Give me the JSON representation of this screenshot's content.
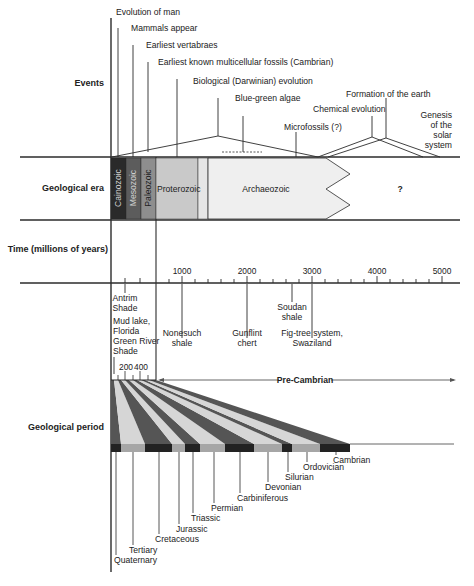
{
  "rows": {
    "events": "Events",
    "era": "Geological era",
    "time": "Time (millions of years)",
    "period": "Geological period"
  },
  "events": [
    {
      "label": "Evolution of man",
      "x": 118,
      "y": 27
    },
    {
      "label": "Mammals appear",
      "x": 133,
      "y": 44
    },
    {
      "label": "Earliest vertabraes",
      "x": 147,
      "y": 61
    },
    {
      "label": "Earliest known multicellular fossils (Cambrian)",
      "x": 160,
      "y": 78
    },
    {
      "label": "Biological (Darwinian) evolution",
      "x": 194,
      "y": 97
    },
    {
      "label": "Blue-green algae",
      "x": 236,
      "y": 114
    },
    {
      "label": "Microfossils (?)",
      "x": 285,
      "y": 131
    },
    {
      "label": "Chemical evolution",
      "x": 314,
      "y": 114
    },
    {
      "label": "Formation of the earth",
      "x": 347,
      "y": 97
    },
    {
      "label_lines": [
        "Genesis",
        "of the",
        "solar",
        "system"
      ]
    }
  ],
  "eras": [
    {
      "name": "Cainozoic",
      "color": "#2a2a2a",
      "text_color": "#cfcfcf"
    },
    {
      "name": "Mesozoic",
      "color": "#5c5c5c",
      "text_color": "#cfcfcf"
    },
    {
      "name": "Paleozoic",
      "color": "#8e8e8e",
      "text_color": "#222222"
    },
    {
      "name": "Proterozoic",
      "color": "#c9c9c9",
      "text_color": "#222222"
    },
    {
      "name": "",
      "color": "#e6e6e6",
      "text_color": "#222222"
    },
    {
      "name": "Archaeozoic",
      "color": "#efefef",
      "text_color": "#222222"
    },
    {
      "name": "?",
      "color": "#ffffff",
      "text_color": "#222222"
    }
  ],
  "time_axis": {
    "ticks": [
      "1000",
      "2000",
      "3000",
      "4000",
      "5000"
    ],
    "fine_ticks": [
      "200",
      "400"
    ]
  },
  "time_markers": [
    {
      "lines": [
        "Antrim",
        "Shade"
      ]
    },
    {
      "lines": [
        "Mud lake,",
        "Florida",
        "Green River",
        "Shade"
      ]
    },
    {
      "lines": [
        "Nonesuch",
        "shale"
      ]
    },
    {
      "lines": [
        "Gunflint",
        "chert"
      ]
    },
    {
      "lines": [
        "Soudan",
        "shale"
      ]
    },
    {
      "lines": [
        "Fig-tree system,",
        "Swaziland"
      ]
    }
  ],
  "precambrian_label": "Pre-Cambrian",
  "periods": [
    {
      "name": "Quaternary"
    },
    {
      "name": "Tertiary"
    },
    {
      "name": "Cretaceous"
    },
    {
      "name": "Jurassic"
    },
    {
      "name": "Triassic"
    },
    {
      "name": "Permian"
    },
    {
      "name": "Carbiniferous"
    },
    {
      "name": "Devonian"
    },
    {
      "name": "Silurian"
    },
    {
      "name": "Ordovician"
    },
    {
      "name": "Cambrian"
    }
  ],
  "colors": {
    "line": "#2b2b2b",
    "dark_stripe": "#555555",
    "light_stripe": "#d6d6d6",
    "black_seg": "#222222",
    "grey_seg": "#a6a6a6"
  }
}
